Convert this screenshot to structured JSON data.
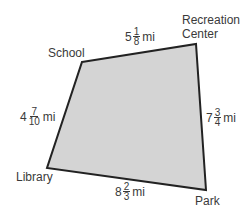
{
  "diagram": {
    "type": "quadrilateral-map",
    "fill_color": "#d4d4d4",
    "stroke_color": "#222222",
    "vertices": [
      {
        "name": "School",
        "x": 82,
        "y": 62
      },
      {
        "name": "Recreation Center",
        "x": 196,
        "y": 44
      },
      {
        "name": "Park",
        "x": 206,
        "y": 190
      },
      {
        "name": "Library",
        "x": 47,
        "y": 168
      }
    ],
    "labels": {
      "school": "School",
      "recreation_line1": "Recreation",
      "recreation_line2": "Center",
      "park": "Park",
      "library": "Library"
    },
    "sides": {
      "school_recreation": {
        "whole": "5",
        "num": "1",
        "den": "8",
        "unit": "mi"
      },
      "recreation_park": {
        "whole": "7",
        "num": "3",
        "den": "4",
        "unit": "mi"
      },
      "park_library": {
        "whole": "8",
        "num": "2",
        "den": "3",
        "unit": "mi"
      },
      "library_school": {
        "whole": "4",
        "num": "7",
        "den": "10",
        "unit": "mi"
      }
    }
  }
}
